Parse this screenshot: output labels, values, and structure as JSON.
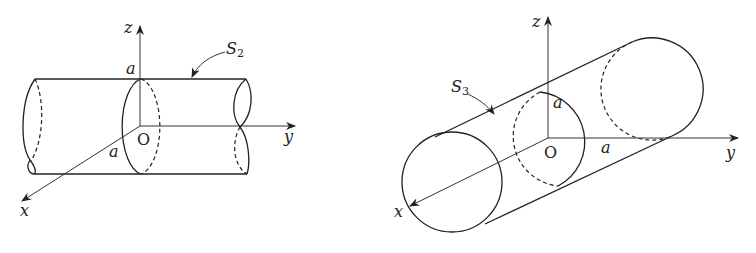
{
  "figures": [
    {
      "id": "left",
      "surface_label": "S",
      "surface_subscript": "2",
      "axes": {
        "x": "x",
        "y": "y",
        "z": "z"
      },
      "origin": "O",
      "radius_label_z": "a",
      "radius_label_x": "a",
      "description": "Cylinder of radius a with axis along y"
    },
    {
      "id": "right",
      "surface_label": "S",
      "surface_subscript": "3",
      "axes": {
        "x": "x",
        "y": "y",
        "z": "z"
      },
      "origin": "O",
      "radius_label_z": "a",
      "radius_label_y": "a",
      "description": "Cylinder of radius a with axis along x"
    }
  ]
}
